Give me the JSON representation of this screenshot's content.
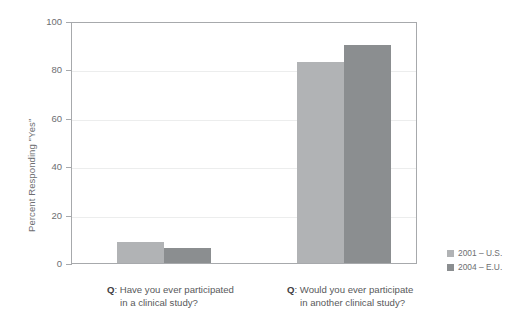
{
  "chart_data": {
    "type": "bar",
    "title": "",
    "subtitle": "",
    "xlabel": "",
    "ylabel": "Percent Responding \"Yes\"",
    "ylim": [
      0,
      100
    ],
    "yticks": [
      0,
      20,
      40,
      60,
      80,
      100
    ],
    "ytick_labels": [
      "0",
      "20",
      "40",
      "60",
      "80",
      "100"
    ],
    "grid": true,
    "legend_position": "right-bottom",
    "categories": [
      "Q: Have you ever participated in a clinical study?",
      "Q: Would you ever participate in another clinical study?"
    ],
    "category_lines": [
      [
        "Have you ever participated",
        "in a clinical study?"
      ],
      [
        "Would you ever participate",
        "in another clinical study?"
      ]
    ],
    "category_prefix": "Q",
    "category_prefix_sep": ":",
    "series": [
      {
        "name": "2001 – U.S.",
        "color": "#b1b3b5",
        "values": [
          8.5,
          83
        ]
      },
      {
        "name": "2004 – E.U.",
        "color": "#8b8e90",
        "values": [
          6,
          90
        ]
      }
    ]
  },
  "legend": {
    "entries": [
      {
        "label": "2001 – U.S.",
        "color": "#b1b3b5"
      },
      {
        "label": "2004 – E.U.",
        "color": "#8b8e90"
      }
    ]
  },
  "axis": {
    "y_title": "Percent Responding \"Yes\"",
    "tick_0": "0",
    "tick_20": "20",
    "tick_40": "40",
    "tick_60": "60",
    "tick_80": "80",
    "tick_100": "100"
  },
  "colors": {
    "series_1": "#b1b3b5",
    "series_2": "#8b8e90",
    "axis": "#a7a9ac",
    "gridline": "#eceded",
    "text": "#58595b",
    "tick_text": "#6d6e71"
  }
}
